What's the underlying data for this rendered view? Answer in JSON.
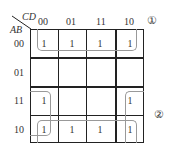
{
  "kmap": {
    "var_top": "CD",
    "var_left": "AB",
    "col_labels": [
      "00",
      "01",
      "11",
      "10"
    ],
    "row_labels": [
      "00",
      "01",
      "11",
      "10"
    ],
    "cells": [
      [
        "1",
        "1",
        "1",
        "1"
      ],
      [
        "",
        "",
        "",
        ""
      ],
      [
        "1",
        "",
        "",
        "1"
      ],
      [
        "1",
        "1",
        "1",
        "1"
      ]
    ],
    "group_markers": [
      "①",
      "②"
    ]
  }
}
